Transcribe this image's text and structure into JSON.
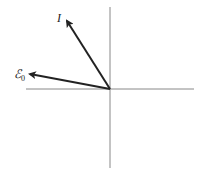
{
  "diagram": {
    "type": "phasor",
    "axes": {
      "origin": [
        110,
        89
      ],
      "horizontal": {
        "x1": 26,
        "x2": 194,
        "y": 89
      },
      "vertical": {
        "x": 110,
        "y1": 7,
        "y2": 168
      },
      "color": "#888888"
    },
    "vectors": [
      {
        "name": "I",
        "label": "I",
        "tip": [
          66,
          20
        ],
        "color": "#222222"
      },
      {
        "name": "E0",
        "label": "ℰ",
        "subscript": "0",
        "tip": [
          29,
          74
        ],
        "color": "#222222"
      }
    ]
  }
}
